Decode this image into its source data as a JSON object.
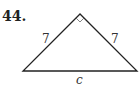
{
  "problem": {
    "number": "44."
  },
  "triangle": {
    "type": "right isosceles triangle",
    "right_angle_at": "apex",
    "sides": {
      "left_leg": "7",
      "right_leg": "7",
      "hypotenuse": "c"
    }
  }
}
